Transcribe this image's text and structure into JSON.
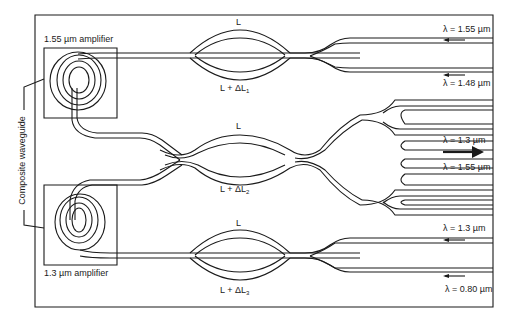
{
  "diagram": {
    "amplifiers": [
      {
        "label": "1.55 µm amplifier"
      },
      {
        "label": "1.3 µm amplifier"
      }
    ],
    "side_label": "Composite waveguide",
    "interferometers": [
      {
        "upper_arm": "L",
        "lower_arm_prefix": "L + ΔL",
        "lower_arm_sub": "1"
      },
      {
        "upper_arm": "L",
        "lower_arm_prefix": "L + ΔL",
        "lower_arm_sub": "2"
      },
      {
        "upper_arm": "L",
        "lower_arm_prefix": "L + ΔL",
        "lower_arm_sub": "3"
      }
    ],
    "ports": [
      {
        "label": "λ = 1.55 µm",
        "direction": "in"
      },
      {
        "label": "λ = 1.48 µm",
        "direction": "in"
      },
      {
        "label": "λ = 1.3 µm",
        "direction": "out"
      },
      {
        "label": "λ = 1.55 µm",
        "direction": "out"
      },
      {
        "label": "λ = 1.3 µm",
        "direction": "in"
      },
      {
        "label": "λ = 0.80 µm",
        "direction": "in"
      }
    ],
    "colors": {
      "line": "#1a1a1a",
      "background": "#ffffff"
    }
  }
}
